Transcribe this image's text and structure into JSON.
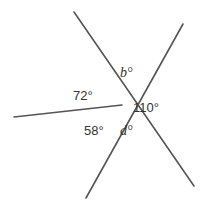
{
  "diagram": {
    "type": "intersecting-lines-angles",
    "center": {
      "x": 122,
      "y": 105
    },
    "lines": [
      {
        "id": "line-a",
        "x1": 74,
        "y1": 12,
        "x2": 194,
        "y2": 186
      },
      {
        "id": "line-b",
        "x1": 183,
        "y1": 24,
        "x2": 86,
        "y2": 198
      },
      {
        "id": "ray-c",
        "x1": 122,
        "y1": 105,
        "x2": 14,
        "y2": 117
      }
    ],
    "labels": {
      "b": "b°",
      "a72": "72°",
      "a110": "110°",
      "a58": "58°",
      "d": "d°"
    },
    "line_color": "#555555",
    "text_color": "#333333"
  }
}
